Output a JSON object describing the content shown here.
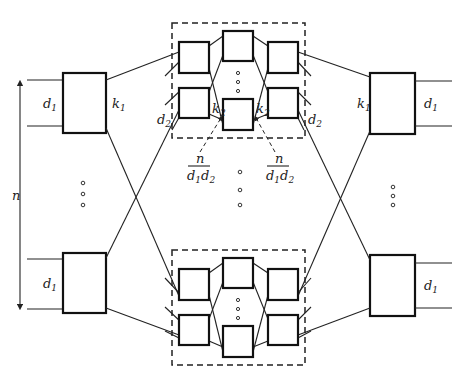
{
  "diagram": {
    "type": "three-stage Clos network",
    "labels": {
      "n": "n",
      "d1": "d",
      "d1_sub": "1",
      "d2": "d",
      "d2_sub": "2",
      "k1": "k",
      "k1_sub": "1",
      "k2": "k",
      "k2_sub": "2",
      "frac_num": "n",
      "frac_den_a": "d",
      "frac_den_a_sub": "1",
      "frac_den_b": "d",
      "frac_den_b_sub": "2"
    },
    "stages": [
      "input switches (d1 × k1)",
      "middle subnetworks (recursive Clos, d2 × k2)",
      "output switches (k1 × d1)"
    ],
    "colors": {
      "stroke": "#111111",
      "background": "#ffffff"
    }
  }
}
